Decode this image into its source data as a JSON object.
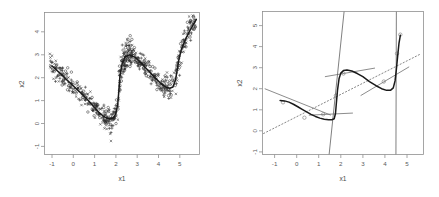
{
  "figure": {
    "panel_count": 2,
    "background": "#ffffff",
    "point_color": "#2a2a2a",
    "curve_color": "#1a1a1a",
    "segment_color": "#666666",
    "dotted_color": "#777777",
    "frame_color": "#8f8f8f"
  },
  "chart_data": [
    {
      "type": "scatter",
      "panel": "left",
      "title": "",
      "xlabel": "x1",
      "ylabel": "x2",
      "xlim": [
        -1.55,
        5.75
      ],
      "ylim": [
        -1.45,
        4.75
      ],
      "xticks": [
        -1,
        0,
        1,
        2,
        3,
        4,
        5
      ],
      "xticklabels": [
        "-1",
        "0",
        "1",
        "2",
        "3",
        "4",
        "5"
      ],
      "yticks": [
        -1,
        0,
        1,
        2,
        3,
        4
      ],
      "yticklabels": [
        "-1",
        "0",
        "1",
        "2",
        "3",
        "4"
      ],
      "grid": false,
      "legend": null,
      "marker_types": [
        "plus",
        "circle",
        "x"
      ],
      "n_points": 600,
      "series": [
        {
          "name": "fitted-curve",
          "type": "line",
          "x": [
            -1.2,
            -1.0,
            -0.8,
            -0.6,
            -0.4,
            -0.2,
            0.0,
            0.2,
            0.4,
            0.6,
            0.8,
            1.0,
            1.2,
            1.4,
            1.55,
            1.7,
            1.8,
            1.9,
            1.95,
            2.0,
            2.1,
            2.25,
            2.45,
            2.7,
            3.0,
            3.3,
            3.6,
            3.9,
            4.15,
            4.35,
            4.5,
            4.62,
            4.7,
            4.78,
            4.9,
            5.1,
            5.35,
            5.6
          ],
          "y": [
            2.42,
            2.25,
            2.08,
            1.9,
            1.72,
            1.55,
            1.38,
            1.2,
            1.02,
            0.82,
            0.6,
            0.4,
            0.24,
            0.13,
            0.1,
            0.16,
            0.3,
            0.75,
            1.3,
            1.95,
            2.5,
            2.82,
            2.9,
            2.8,
            2.55,
            2.25,
            1.95,
            1.68,
            1.5,
            1.44,
            1.5,
            1.8,
            2.25,
            2.7,
            3.15,
            3.6,
            4.05,
            4.45
          ]
        }
      ],
      "scatter_cloud_note": "dense noisy cloud of ~600 points scattered about the fitted curve"
    },
    {
      "type": "line",
      "panel": "right",
      "title": "",
      "xlabel": "x1",
      "ylabel": "x2",
      "xlim": [
        -1.55,
        5.75
      ],
      "ylim": [
        -1.25,
        5.55
      ],
      "xticks": [
        -1,
        0,
        1,
        2,
        3,
        4,
        5
      ],
      "xticklabels": [
        "-1",
        "0",
        "1",
        "2",
        "3",
        "4",
        "5"
      ],
      "yticks": [
        -1,
        0,
        1,
        2,
        3,
        4,
        5
      ],
      "yticklabels": [
        "-1",
        "0",
        "1",
        "2",
        "3",
        "4",
        "5"
      ],
      "grid": false,
      "legend": null,
      "series": [
        {
          "name": "fitted-curve",
          "type": "line",
          "style": "solid-thick",
          "x": [
            -0.75,
            -0.55,
            -0.35,
            -0.15,
            0.05,
            0.25,
            0.45,
            0.65,
            0.85,
            1.05,
            1.25,
            1.45,
            1.6,
            1.7,
            1.76,
            1.8,
            1.85,
            1.92,
            2.0,
            2.12,
            2.28,
            2.5,
            2.75,
            3.0,
            3.3,
            3.6,
            3.85,
            4.08,
            4.25,
            4.38,
            4.46,
            4.52,
            4.58,
            4.64,
            4.7
          ],
          "y": [
            1.32,
            1.3,
            1.24,
            1.14,
            1.02,
            0.9,
            0.78,
            0.66,
            0.56,
            0.48,
            0.43,
            0.4,
            0.4,
            0.45,
            0.7,
            1.2,
            1.8,
            2.35,
            2.62,
            2.74,
            2.77,
            2.72,
            2.6,
            2.45,
            2.22,
            2.02,
            1.88,
            1.8,
            1.8,
            1.92,
            2.25,
            2.8,
            3.45,
            4.05,
            4.42
          ]
        },
        {
          "name": "local-linear-segments",
          "type": "segments",
          "style": "thin-gray",
          "segments": [
            {
              "x1": -1.45,
              "y1": 1.88,
              "x2": 1.55,
              "y2": 0.62,
              "marker_x": -0.62,
              "marker_y": 1.23
            },
            {
              "x1": 0.55,
              "y1": 0.62,
              "x2": 2.55,
              "y2": 0.72,
              "marker_x": 1.2,
              "marker_y": 0.66
            },
            {
              "x1": 1.28,
              "y1": 2.45,
              "x2": 3.55,
              "y2": 2.86,
              "marker_x": 2.12,
              "marker_y": 2.6
            },
            {
              "x1": 2.9,
              "y1": 1.55,
              "x2": 5.1,
              "y2": 2.92,
              "marker_x": 3.95,
              "marker_y": 2.22
            }
          ]
        },
        {
          "name": "global-linear-fit",
          "type": "line",
          "style": "dotted",
          "x1": -1.5,
          "y1": -0.25,
          "x2": 5.6,
          "y2": 3.52
        },
        {
          "name": "vertical-boundary-1",
          "type": "vline",
          "x1": 1.47,
          "y1": -1.25,
          "x2": 2.15,
          "y2": 5.55
        },
        {
          "name": "vertical-boundary-2",
          "type": "vline",
          "x1": 4.5,
          "y1": -1.25,
          "x2": 4.52,
          "y2": 5.55
        }
      ]
    }
  ]
}
